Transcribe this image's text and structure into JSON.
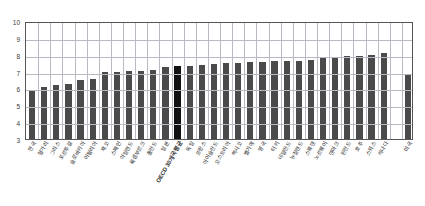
{
  "chart_data": {
    "type": "bar",
    "title": "",
    "subtitle": "",
    "xlabel": "",
    "ylabel": "",
    "ylim": [
      3,
      10
    ],
    "yticks": [
      3,
      4,
      5,
      6,
      7,
      8,
      9,
      10
    ],
    "grid": true,
    "legend": null,
    "bar_color": "#4a4a4a",
    "highlight_color": "#111111",
    "highlight_category": "OECD 30개국 평균",
    "separated_last_bar": true,
    "categories": [
      "한국",
      "헝가리",
      "그리스",
      "포르투갈",
      "슬로바키아",
      "이탈리아",
      "체코",
      "스페인",
      "아일랜드",
      "룩셈부르크",
      "폴란드",
      "일본",
      "OECD 30개국 평균",
      "독일",
      "프랑스",
      "아이슬란드",
      "오스트리아",
      "멕시코",
      "벨기에",
      "영국",
      "터키",
      "네덜란드",
      "뉴질랜드",
      "스웨덴",
      "노르웨이",
      "덴마크",
      "핀란드",
      "호주",
      "스위스",
      "캐나다",
      "미국"
    ],
    "values": [
      5.9,
      6.1,
      6.2,
      6.25,
      6.5,
      6.55,
      6.95,
      6.95,
      7.05,
      7.05,
      7.1,
      7.25,
      7.35,
      7.35,
      7.4,
      7.45,
      7.5,
      7.5,
      7.55,
      7.55,
      7.6,
      7.6,
      7.65,
      7.7,
      7.8,
      7.85,
      7.9,
      7.95,
      8.0,
      8.1,
      6.8
    ]
  }
}
